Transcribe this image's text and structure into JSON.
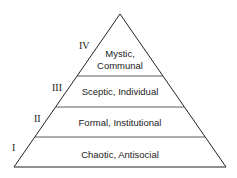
{
  "diagram": {
    "type": "pyramid",
    "levels": [
      {
        "numeral": "IV",
        "lines": [
          "Mystic,",
          "Communal"
        ]
      },
      {
        "numeral": "III",
        "lines": [
          "Sceptic, Individual"
        ]
      },
      {
        "numeral": "II",
        "lines": [
          "Formal, Institutional"
        ]
      },
      {
        "numeral": "I",
        "lines": [
          "Chaotic, Antisocial"
        ]
      }
    ]
  }
}
